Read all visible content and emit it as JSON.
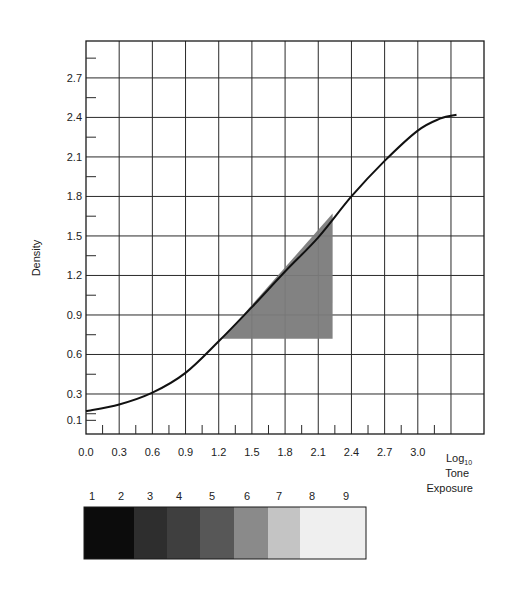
{
  "chart_data": {
    "type": "line",
    "title": "",
    "xlabel": "Log10 Tone Exposure",
    "xlabel_lines": [
      "Log",
      "Tone",
      "Exposure"
    ],
    "xlabel_subscript": "10",
    "ylabel": "Density",
    "xlim": [
      0.0,
      3.6
    ],
    "ylim": [
      0.0,
      3.0
    ],
    "grid": true,
    "legend": null,
    "x_ticks": [
      0.0,
      0.3,
      0.6,
      0.9,
      1.2,
      1.5,
      1.8,
      2.1,
      2.4,
      2.7,
      3.0
    ],
    "x_tick_labels": [
      "0.0",
      "0.3",
      "0.6",
      "0.9",
      "1.2",
      "1.5",
      "1.8",
      "2.1",
      "2.4",
      "2.7",
      "3.0"
    ],
    "y_ticks": [
      0.1,
      0.3,
      0.6,
      0.9,
      1.2,
      1.5,
      1.8,
      2.1,
      2.4,
      2.7
    ],
    "y_tick_labels": [
      "0.1",
      "0.3",
      "0.6",
      "0.9",
      "1.2",
      "1.5",
      "1.8",
      "2.1",
      "2.4",
      "2.7"
    ],
    "series": [
      {
        "name": "characteristic curve",
        "x": [
          0.0,
          0.3,
          0.6,
          0.9,
          1.2,
          1.5,
          1.8,
          2.1,
          2.4,
          2.7,
          3.0,
          3.2,
          3.35
        ],
        "y": [
          0.17,
          0.22,
          0.31,
          0.46,
          0.7,
          0.96,
          1.23,
          1.49,
          1.8,
          2.07,
          2.3,
          2.39,
          2.42
        ]
      }
    ],
    "annotations": [
      {
        "type": "shaded-triangle",
        "description": "gradient (gamma) triangle under straight-line portion",
        "points": [
          [
            1.23,
            0.72
          ],
          [
            2.23,
            0.72
          ],
          [
            2.23,
            1.67
          ]
        ],
        "color": "#7b7b7b"
      }
    ],
    "gray_scale_strip": {
      "labels": [
        "1",
        "2",
        "3",
        "4",
        "5",
        "6",
        "7",
        "8",
        "9"
      ],
      "segments": [
        {
          "steps": "1-2",
          "color": "#0c0c0c",
          "width": 50
        },
        {
          "steps": "3",
          "color": "#2e2e2e",
          "width": 33
        },
        {
          "steps": "4",
          "color": "#3f3f3f",
          "width": 33
        },
        {
          "steps": "5",
          "color": "#575757",
          "width": 34
        },
        {
          "steps": "6",
          "color": "#8a8a8a",
          "width": 34
        },
        {
          "steps": "7",
          "color": "#c4c4c4",
          "width": 32
        },
        {
          "steps": "8-9",
          "color": "#efefef",
          "width": 66
        }
      ]
    }
  }
}
